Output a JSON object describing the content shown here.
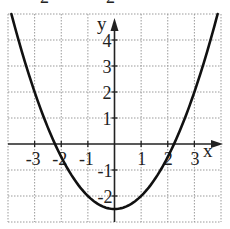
{
  "chart_data": {
    "type": "line",
    "title": "",
    "xlabel": "x",
    "ylabel": "y",
    "xlim": [
      -4,
      4
    ],
    "ylim": [
      -3,
      5
    ],
    "grid": true,
    "grid_style": "dotted",
    "x_ticks": [
      -3,
      -2,
      -1,
      1,
      2,
      3
    ],
    "y_ticks": [
      -2,
      -1,
      1,
      2,
      3,
      4
    ],
    "x_tick_labels": [
      "-3",
      "-2",
      "-1",
      "1",
      "2",
      "3"
    ],
    "y_tick_labels": [
      "-2",
      "-1",
      "1",
      "2",
      "3",
      "4"
    ],
    "series": [
      {
        "name": "parabola",
        "equation": "y = 0.5x^2 - 2.5",
        "x": [
          -3.87,
          -3.5,
          -3,
          -2.5,
          -2.24,
          -2,
          -1.5,
          -1,
          -0.5,
          0,
          0.5,
          1,
          1.5,
          2,
          2.24,
          2.5,
          3,
          3.5,
          3.87
        ],
        "y": [
          5.0,
          3.63,
          2.0,
          0.63,
          0.0,
          -0.5,
          -1.38,
          -2.0,
          -2.38,
          -2.5,
          -2.38,
          -2.0,
          -1.38,
          -0.5,
          0.0,
          0.63,
          2.0,
          3.63,
          5.0
        ]
      }
    ],
    "vertex": [
      0,
      -2.5
    ],
    "roots": [
      -2.24,
      2.24
    ]
  },
  "labels": {
    "x_axis": "x",
    "y_axis": "y",
    "top_cut_glyph_1": "2",
    "top_cut_glyph_2": "2"
  },
  "colors": {
    "curve": "#111111",
    "axis": "#222222",
    "grid": "#9a9a9a",
    "background": "#ffffff"
  }
}
